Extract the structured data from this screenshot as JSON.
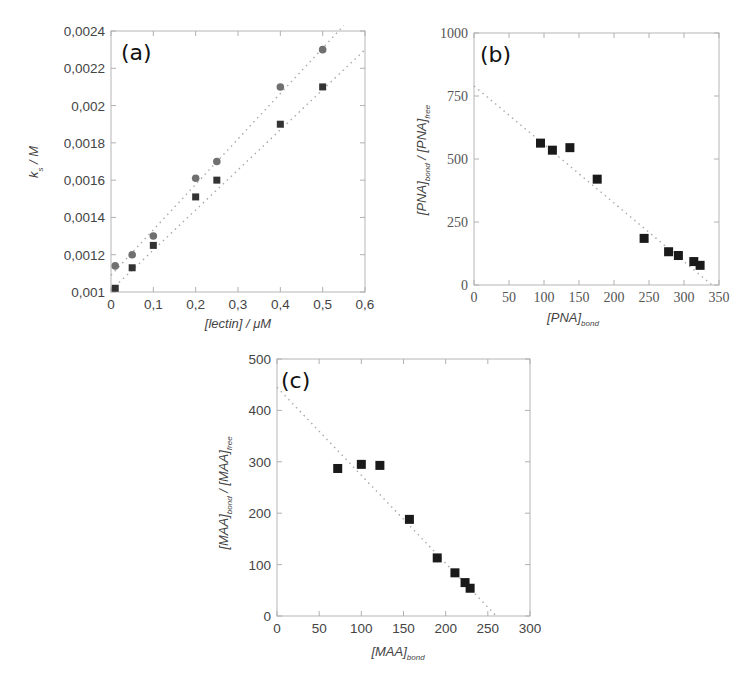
{
  "figure": {
    "panels": [
      {
        "tag": "(a)"
      },
      {
        "tag": "(b)"
      },
      {
        "tag": "(c)"
      }
    ]
  },
  "chart_data": [
    {
      "id": "a",
      "type": "scatter",
      "title": "(a)",
      "xlabel": "[lectin] / μM",
      "ylabel": "k_s / M",
      "ylabel_main": "k",
      "ylabel_sub": "s",
      "ylabel_rest": " / M",
      "xlim": [
        0,
        0.6
      ],
      "ylim": [
        0.001,
        0.0024
      ],
      "xticks": [
        "0",
        "0,1",
        "0,2",
        "0,3",
        "0,4",
        "0,5",
        "0,6"
      ],
      "yticks": [
        "0,001",
        "0,0012",
        "0,0014",
        "0,0016",
        "0,0018",
        "0,002",
        "0,0022",
        "0,0024"
      ],
      "grid": false,
      "series": [
        {
          "name": "circles",
          "marker": "circle",
          "color": "#707070",
          "x": [
            0.01,
            0.05,
            0.1,
            0.2,
            0.25,
            0.4,
            0.5
          ],
          "y": [
            0.00114,
            0.0012,
            0.0013,
            0.00161,
            0.0017,
            0.0021,
            0.0023
          ],
          "fit": {
            "x": [
              0.0,
              0.55
            ],
            "y": [
              0.00109,
              0.00243
            ]
          }
        },
        {
          "name": "squares",
          "marker": "square",
          "color": "#333333",
          "x": [
            0.01,
            0.05,
            0.1,
            0.2,
            0.25,
            0.4,
            0.5
          ],
          "y": [
            0.00102,
            0.00113,
            0.00125,
            0.00151,
            0.0016,
            0.0019,
            0.0021
          ],
          "fit": {
            "x": [
              0.0,
              0.6
            ],
            "y": [
              0.00101,
              0.0023
            ]
          }
        }
      ]
    },
    {
      "id": "b",
      "type": "scatter",
      "title": "(b)",
      "xlabel": "[PNA]_bond",
      "xlabel_main": "[PNA]",
      "xlabel_sub": "bond",
      "ylabel": "[PNA]_bond / [PNA]_free",
      "ylabel_parts": {
        "a": "[PNA]",
        "a_sub": "bond",
        "b": " / [PNA]",
        "b_sub": "free"
      },
      "xlim": [
        0,
        350
      ],
      "ylim": [
        0,
        1000
      ],
      "xticks": [
        "0",
        "50",
        "100",
        "150",
        "200",
        "250",
        "300",
        "350"
      ],
      "yticks": [
        "0",
        "250",
        "500",
        "750",
        "1000"
      ],
      "grid": false,
      "series": [
        {
          "name": "PNA",
          "marker": "square",
          "color": "#1a1a1a",
          "x": [
            95,
            112,
            137,
            176,
            243,
            278,
            292,
            314,
            323
          ],
          "y": [
            563,
            535,
            545,
            420,
            185,
            132,
            117,
            93,
            78
          ],
          "fit": {
            "x": [
              0,
              340
            ],
            "y": [
              790,
              0
            ]
          }
        }
      ]
    },
    {
      "id": "c",
      "type": "scatter",
      "title": "(c)",
      "xlabel": "[MAA]_bond",
      "xlabel_main": "[MAA]",
      "xlabel_sub": "bond",
      "ylabel": "[MAA]_bond / [MAA]_free",
      "ylabel_parts": {
        "a": "[MAA]",
        "a_sub": "bond",
        "b": " / [MAA]",
        "b_sub": "free"
      },
      "xlim": [
        0,
        300
      ],
      "ylim": [
        0,
        500
      ],
      "xticks": [
        "0",
        "50",
        "100",
        "150",
        "200",
        "250",
        "300"
      ],
      "yticks": [
        "0",
        "100",
        "200",
        "300",
        "400",
        "500"
      ],
      "grid": false,
      "series": [
        {
          "name": "MAA",
          "marker": "square",
          "color": "#1a1a1a",
          "x": [
            72,
            100,
            122,
            157,
            190,
            211,
            223,
            229
          ],
          "y": [
            287,
            295,
            293,
            188,
            113,
            84,
            65,
            54
          ],
          "fit": {
            "x": [
              0,
              260
            ],
            "y": [
              445,
              0
            ]
          }
        }
      ]
    }
  ]
}
